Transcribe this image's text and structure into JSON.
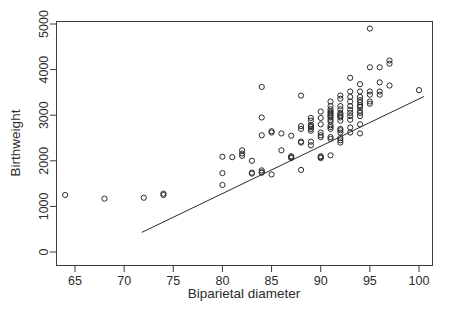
{
  "chart_data": {
    "type": "scatter",
    "title": "",
    "xlabel": "Biparietal diameter",
    "ylabel": "Birthweight",
    "xlim": [
      63.0,
      101.3
    ],
    "ylim": [
      -120,
      5220
    ],
    "xticks": [
      65,
      70,
      75,
      80,
      85,
      90,
      95,
      100
    ],
    "yticks": [
      0,
      1000,
      2000,
      3000,
      4000,
      5000
    ],
    "xtick_labels": [
      "65",
      "70",
      "75",
      "80",
      "85",
      "90",
      "95",
      "100"
    ],
    "ytick_labels": [
      "0",
      "1000",
      "2000",
      "3000",
      "4000",
      "5000"
    ],
    "grid": false,
    "legend": false,
    "marker": "open-circle",
    "point_color": "#2b2b2b",
    "line_color": "#2b2b2b",
    "background": "#ffffff",
    "fit_line": {
      "label": "regression line",
      "x": [
        71.8,
        100.5
      ],
      "y": [
        430,
        3410
      ]
    },
    "points": [
      [
        64,
        1250
      ],
      [
        68,
        1170
      ],
      [
        72,
        1190
      ],
      [
        74,
        1280
      ],
      [
        74,
        1250
      ],
      [
        80,
        2090
      ],
      [
        80,
        1730
      ],
      [
        80,
        1470
      ],
      [
        81,
        2080
      ],
      [
        82,
        2230
      ],
      [
        82,
        2160
      ],
      [
        82,
        2110
      ],
      [
        83,
        2000
      ],
      [
        83,
        1740
      ],
      [
        83,
        1720
      ],
      [
        84,
        3620
      ],
      [
        84,
        2950
      ],
      [
        84,
        2560
      ],
      [
        84,
        1790
      ],
      [
        84,
        1750
      ],
      [
        84,
        1740
      ],
      [
        85,
        2650
      ],
      [
        85,
        2620
      ],
      [
        85,
        1700
      ],
      [
        86,
        2600
      ],
      [
        86,
        2230
      ],
      [
        87,
        2550
      ],
      [
        87,
        2100
      ],
      [
        87,
        2080
      ],
      [
        87,
        2060
      ],
      [
        88,
        3430
      ],
      [
        88,
        2760
      ],
      [
        88,
        2700
      ],
      [
        88,
        2420
      ],
      [
        88,
        2400
      ],
      [
        88,
        1800
      ],
      [
        89,
        2940
      ],
      [
        89,
        2880
      ],
      [
        89,
        2790
      ],
      [
        89,
        2760
      ],
      [
        89,
        2740
      ],
      [
        89,
        2700
      ],
      [
        89,
        2660
      ],
      [
        89,
        2420
      ],
      [
        89,
        2340
      ],
      [
        90,
        3080
      ],
      [
        90,
        2940
      ],
      [
        90,
        2800
      ],
      [
        90,
        2620
      ],
      [
        90,
        2560
      ],
      [
        90,
        2520
      ],
      [
        90,
        2100
      ],
      [
        90,
        2080
      ],
      [
        90,
        2060
      ],
      [
        91,
        3300
      ],
      [
        91,
        3200
      ],
      [
        91,
        3130
      ],
      [
        91,
        3080
      ],
      [
        91,
        3050
      ],
      [
        91,
        3010
      ],
      [
        91,
        2980
      ],
      [
        91,
        2950
      ],
      [
        91,
        2900
      ],
      [
        91,
        2860
      ],
      [
        91,
        2780
      ],
      [
        91,
        2740
      ],
      [
        91,
        2700
      ],
      [
        91,
        2520
      ],
      [
        91,
        2480
      ],
      [
        91,
        2120
      ],
      [
        92,
        3430
      ],
      [
        92,
        3360
      ],
      [
        92,
        3200
      ],
      [
        92,
        3130
      ],
      [
        92,
        3050
      ],
      [
        92,
        3010
      ],
      [
        92,
        2980
      ],
      [
        92,
        2950
      ],
      [
        92,
        2880
      ],
      [
        92,
        2700
      ],
      [
        92,
        2670
      ],
      [
        92,
        2620
      ],
      [
        92,
        2500
      ],
      [
        92,
        2450
      ],
      [
        92,
        2400
      ],
      [
        93,
        3820
      ],
      [
        93,
        3520
      ],
      [
        93,
        3400
      ],
      [
        93,
        3300
      ],
      [
        93,
        3200
      ],
      [
        93,
        3120
      ],
      [
        93,
        3050
      ],
      [
        93,
        2980
      ],
      [
        93,
        2900
      ],
      [
        93,
        2730
      ],
      [
        93,
        2620
      ],
      [
        94,
        3680
      ],
      [
        94,
        3520
      ],
      [
        94,
        3400
      ],
      [
        94,
        3330
      ],
      [
        94,
        3280
      ],
      [
        94,
        3220
      ],
      [
        94,
        3180
      ],
      [
        94,
        3100
      ],
      [
        94,
        3050
      ],
      [
        94,
        2980
      ],
      [
        94,
        2800
      ],
      [
        94,
        2600
      ],
      [
        95,
        4900
      ],
      [
        95,
        4050
      ],
      [
        95,
        3520
      ],
      [
        95,
        3450
      ],
      [
        95,
        3300
      ],
      [
        95,
        3250
      ],
      [
        96,
        4050
      ],
      [
        96,
        3720
      ],
      [
        96,
        3520
      ],
      [
        96,
        3450
      ],
      [
        97,
        4200
      ],
      [
        97,
        4130
      ],
      [
        97,
        3650
      ],
      [
        100,
        3550
      ]
    ]
  }
}
